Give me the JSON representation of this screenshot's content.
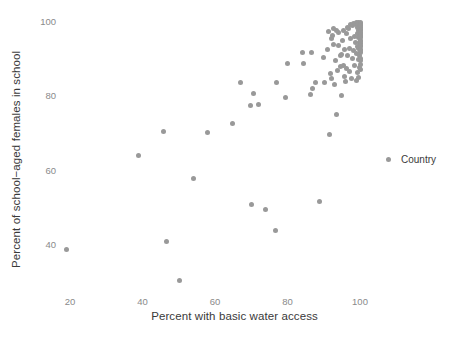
{
  "chart_data": {
    "type": "scatter",
    "title": "",
    "xlabel": "Percent with basic water access",
    "ylabel": "Percent of school−aged females in school",
    "xlim": [
      14,
      103
    ],
    "ylim": [
      27,
      101
    ],
    "xticks": [
      20,
      40,
      60,
      80,
      100
    ],
    "yticks": [
      40,
      60,
      80,
      100
    ],
    "xtick_labels": [
      "20",
      "40",
      "60",
      "80",
      "100"
    ],
    "ytick_labels": [
      "40",
      "60",
      "80",
      "100"
    ],
    "grid": false,
    "legend": {
      "position": "right",
      "entries": [
        {
          "label": "Country",
          "color": "#999999",
          "marker": "circle"
        }
      ]
    },
    "point_color": "#999999",
    "point_size": 5,
    "series": [
      {
        "name": "Country",
        "points": [
          [
            19.0,
            38.8
          ],
          [
            39.0,
            64.2
          ],
          [
            46.5,
            41.0
          ],
          [
            45.8,
            70.5
          ],
          [
            50.3,
            30.5
          ],
          [
            54.2,
            57.8
          ],
          [
            58.0,
            70.3
          ],
          [
            64.8,
            72.8
          ],
          [
            67.0,
            83.6
          ],
          [
            69.8,
            77.6
          ],
          [
            70.0,
            50.8
          ],
          [
            70.5,
            80.8
          ],
          [
            72.0,
            77.8
          ],
          [
            73.8,
            49.5
          ],
          [
            76.8,
            43.9
          ],
          [
            77.0,
            83.6
          ],
          [
            79.5,
            79.8
          ],
          [
            80.0,
            88.9
          ],
          [
            84.2,
            91.7
          ],
          [
            84.5,
            88.8
          ],
          [
            86.3,
            80.4
          ],
          [
            86.5,
            91.7
          ],
          [
            86.8,
            82.0
          ],
          [
            87.8,
            83.8
          ],
          [
            88.8,
            51.6
          ],
          [
            89.8,
            90.5
          ],
          [
            90.2,
            83.8
          ],
          [
            91.0,
            92.6
          ],
          [
            91.5,
            69.7
          ],
          [
            91.8,
            86.2
          ],
          [
            92.0,
            84.8
          ],
          [
            92.2,
            95.5
          ],
          [
            92.5,
            96.5
          ],
          [
            92.8,
            94.0
          ],
          [
            93.0,
            83.2
          ],
          [
            93.5,
            75.2
          ],
          [
            93.8,
            86.9
          ],
          [
            94.0,
            93.8
          ],
          [
            94.2,
            97.2
          ],
          [
            94.5,
            90.9
          ],
          [
            94.8,
            80.3
          ],
          [
            95.0,
            91.2
          ],
          [
            95.2,
            95.1
          ],
          [
            95.5,
            88.2
          ],
          [
            95.8,
            92.6
          ],
          [
            96.0,
            83.9
          ],
          [
            96.2,
            96.8
          ],
          [
            96.5,
            91.0
          ],
          [
            96.8,
            98.2
          ],
          [
            97.0,
            93.0
          ],
          [
            97.2,
            86.6
          ],
          [
            97.5,
            95.6
          ],
          [
            97.8,
            90.2
          ],
          [
            98.0,
            99.0
          ],
          [
            98.2,
            92.2
          ],
          [
            98.4,
            96.2
          ],
          [
            98.6,
            88.4
          ],
          [
            98.8,
            94.4
          ],
          [
            99.0,
            99.4
          ],
          [
            99.0,
            91.6
          ],
          [
            99.2,
            97.0
          ],
          [
            99.2,
            86.5
          ],
          [
            99.4,
            93.4
          ],
          [
            99.4,
            98.6
          ],
          [
            99.5,
            89.8
          ],
          [
            99.6,
            95.8
          ],
          [
            99.6,
            99.8
          ],
          [
            99.7,
            92.8
          ],
          [
            99.7,
            97.6
          ],
          [
            99.8,
            87.8
          ],
          [
            99.8,
            94.6
          ],
          [
            99.8,
            99.2
          ],
          [
            99.9,
            91.0
          ],
          [
            99.9,
            96.4
          ],
          [
            99.9,
            98.8
          ],
          [
            100.0,
            88.6
          ],
          [
            100.0,
            90.2
          ],
          [
            100.0,
            91.8
          ],
          [
            100.0,
            92.6
          ],
          [
            100.0,
            93.4
          ],
          [
            100.0,
            94.2
          ],
          [
            100.0,
            95.0
          ],
          [
            100.0,
            95.8
          ],
          [
            100.0,
            96.4
          ],
          [
            100.0,
            97.0
          ],
          [
            100.0,
            97.6
          ],
          [
            100.0,
            98.0
          ],
          [
            100.0,
            98.4
          ],
          [
            100.0,
            98.8
          ],
          [
            100.0,
            99.2
          ],
          [
            100.0,
            99.6
          ],
          [
            100.0,
            100.0
          ],
          [
            100.0,
            99.0
          ],
          [
            100.0,
            97.2
          ],
          [
            100.0,
            96.0
          ],
          [
            100.0,
            94.8
          ],
          [
            100.0,
            93.8
          ],
          [
            100.0,
            92.2
          ],
          [
            100.0,
            89.6
          ],
          [
            100.0,
            87.2
          ],
          [
            99.5,
            85.0
          ],
          [
            98.9,
            84.2
          ],
          [
            97.6,
            84.9
          ],
          [
            96.4,
            87.4
          ],
          [
            95.6,
            85.4
          ],
          [
            94.6,
            88.0
          ],
          [
            93.2,
            89.6
          ],
          [
            99.1,
            100.0
          ],
          [
            98.3,
            99.6
          ],
          [
            97.4,
            99.2
          ],
          [
            96.6,
            98.4
          ],
          [
            95.4,
            97.8
          ],
          [
            93.6,
            97.6
          ],
          [
            92.6,
            98.2
          ],
          [
            91.2,
            97.4
          ]
        ]
      }
    ]
  },
  "legend": {
    "title_label": "Country"
  }
}
